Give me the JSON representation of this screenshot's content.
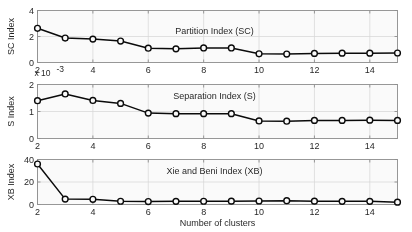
{
  "figure": {
    "background": "#ffffff",
    "line_color": "#000000",
    "marker": "open-circle",
    "grid": true,
    "grid_color": "#d9d9d9",
    "axis_color": "#8c8c8c",
    "xlabel": "Number of clusters",
    "xticks": [
      2,
      4,
      6,
      8,
      10,
      12,
      14
    ],
    "xlim": [
      2,
      15
    ]
  },
  "chart_data": [
    {
      "type": "line",
      "title": "Partition Index (SC)",
      "xlabel": "",
      "ylabel": "SC Index",
      "y_multiplier": "x 10",
      "y_multiplier_exponent": "-3",
      "x": [
        2,
        3,
        4,
        5,
        6,
        7,
        8,
        9,
        10,
        11,
        12,
        13,
        14,
        15
      ],
      "values": [
        2.63,
        1.88,
        1.8,
        1.65,
        1.1,
        1.05,
        1.12,
        1.12,
        0.67,
        0.65,
        0.7,
        0.72,
        0.72,
        0.73
      ],
      "xlim": [
        2,
        15
      ],
      "ylim": [
        0,
        4
      ],
      "yticks": [
        0,
        2,
        4
      ],
      "xticks": [
        2,
        4,
        6,
        8,
        10,
        12,
        14
      ],
      "grid": true,
      "legend": null
    },
    {
      "type": "line",
      "title": "Separation Index (S)",
      "xlabel": "",
      "ylabel": "S Index",
      "x": [
        2,
        3,
        4,
        5,
        6,
        7,
        8,
        9,
        10,
        11,
        12,
        13,
        14,
        15
      ],
      "values": [
        1.4,
        1.65,
        1.41,
        1.3,
        0.94,
        0.92,
        0.92,
        0.92,
        0.65,
        0.64,
        0.67,
        0.67,
        0.68,
        0.67
      ],
      "xlim": [
        2,
        15
      ],
      "ylim": [
        0,
        2
      ],
      "yticks": [
        0,
        1,
        2
      ],
      "xticks": [
        2,
        4,
        6,
        8,
        10,
        12,
        14
      ],
      "grid": true,
      "legend": null
    },
    {
      "type": "line",
      "title": "Xie and Beni Index (XB)",
      "xlabel": "Number of clusters",
      "ylabel": "XB Index",
      "x": [
        2,
        3,
        4,
        5,
        6,
        7,
        8,
        9,
        10,
        11,
        12,
        13,
        14,
        15
      ],
      "values": [
        36.0,
        4.8,
        4.6,
        2.9,
        2.6,
        2.8,
        2.9,
        3.0,
        3.1,
        3.4,
        3.0,
        2.8,
        2.8,
        2.1
      ],
      "xlim": [
        2,
        15
      ],
      "ylim": [
        0,
        40
      ],
      "yticks": [
        0,
        20,
        40
      ],
      "xticks": [
        2,
        4,
        6,
        8,
        10,
        12,
        14
      ],
      "grid": true,
      "legend": null
    }
  ]
}
